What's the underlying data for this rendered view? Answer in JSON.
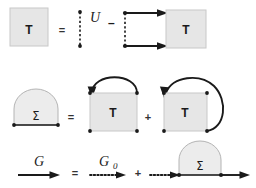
{
  "figure": {
    "background_color": "#ffffff",
    "ink_color": "#1a1a1a",
    "box_fill": "#e6e6e6",
    "box_stroke": "#c8c8c8",
    "blob_fill": "#ececec",
    "blob_stroke": "#b4b4b4"
  },
  "rows": [
    {
      "id": "row-t-matrix",
      "name": "t-matrix-equation",
      "elements": {
        "lhs_box_label": "T",
        "equals": "=",
        "interaction_label": "U",
        "minus": "–",
        "rhs_box_label": "T"
      }
    },
    {
      "id": "row-self-energy",
      "name": "self-energy-equation",
      "elements": {
        "lhs_blob_label": "Σ",
        "equals": "=",
        "first_box_label": "T",
        "plus": "+",
        "second_box_label": "T"
      }
    },
    {
      "id": "row-dyson",
      "name": "dyson-equation",
      "elements": {
        "g_label": "G",
        "equals": "=",
        "g0_label_base": "G",
        "g0_label_sub": "0",
        "plus": "+",
        "sigma_label": "Σ"
      }
    }
  ]
}
